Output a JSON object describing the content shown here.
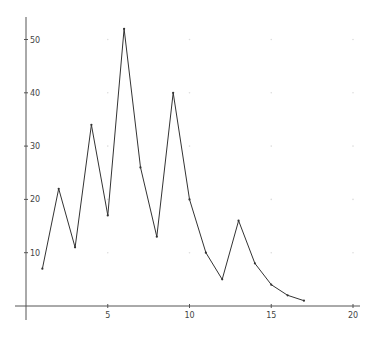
{
  "chart_data": {
    "type": "line",
    "title": "",
    "xlabel": "",
    "ylabel": "",
    "x": [
      1,
      2,
      3,
      4,
      5,
      6,
      7,
      8,
      9,
      10,
      11,
      12,
      13,
      14,
      15,
      16,
      17
    ],
    "series": [
      {
        "name": "series",
        "values": [
          7,
          22,
          11,
          34,
          17,
          52,
          26,
          13,
          40,
          20,
          10,
          5,
          16,
          8,
          4,
          2,
          1
        ],
        "markers": true
      }
    ],
    "xlim": [
      -0.7,
      20.5
    ],
    "ylim": [
      -2.5,
      54.5
    ],
    "xticks": [
      5,
      10,
      15,
      20
    ],
    "yticks": [
      10,
      20,
      30,
      40,
      50
    ],
    "grid": "faint dots at tick intersections",
    "legend": "none"
  },
  "style": {
    "line_color": "#333333",
    "axis_color": "#555555",
    "grid_dot_color": "#dddddd",
    "background": "#ffffff"
  }
}
